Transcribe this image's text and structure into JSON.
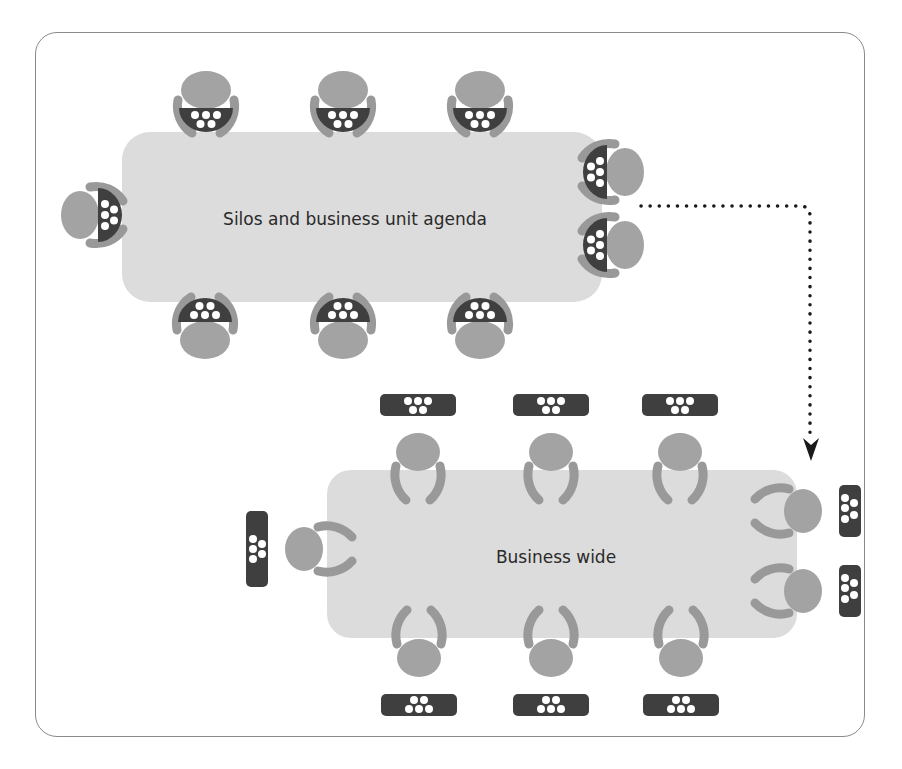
{
  "diagram": {
    "colors": {
      "table": "#dcdcdc",
      "head": "#a3a3a3",
      "chair": "#999999",
      "device": "#3f3f3f",
      "device_dot": "#ffffff",
      "arrow": "#1a1a1a",
      "frame": "#8a8a8a"
    },
    "tables": [
      {
        "id": "silos",
        "label": "Silos and business unit agenda",
        "seat_style": "devices-facing-table-integrated",
        "seats": 10
      },
      {
        "id": "business-wide",
        "label": "Business wide",
        "seat_style": "devices-set-aside",
        "seats": 10
      }
    ],
    "connector": {
      "style": "dotted",
      "from": "silos",
      "to": "business-wide",
      "icon": "arrow-down-icon"
    }
  }
}
